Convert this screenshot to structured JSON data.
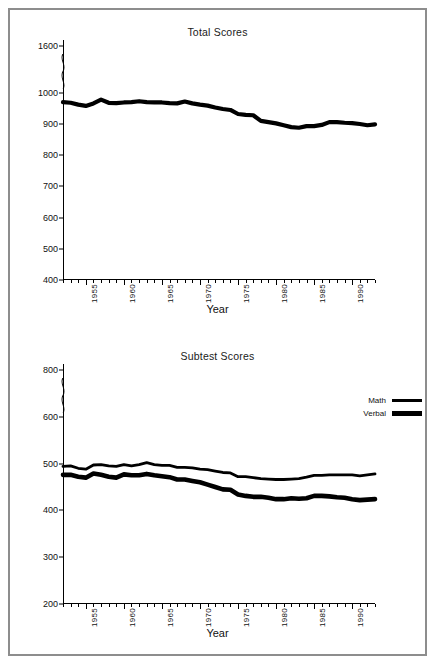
{
  "figure": {
    "border_color": "#8d8d8d",
    "background": "#ffffff",
    "line_color": "#000000"
  },
  "panels": {
    "total": {
      "title": "Total Scores",
      "xlabel": "Year",
      "ytick_labels": [
        "400",
        "500",
        "600",
        "700",
        "800",
        "900",
        "1000",
        "1600"
      ],
      "xtick_labels": [
        "1955",
        "1960",
        "1965",
        "1970",
        "1975",
        "1980",
        "1985",
        "1990"
      ]
    },
    "subtest": {
      "title": "Subtest Scores",
      "xlabel": "Year",
      "ytick_labels": [
        "200",
        "300",
        "400",
        "500",
        "600",
        "800"
      ],
      "xtick_labels": [
        "1955",
        "1960",
        "1965",
        "1970",
        "1975",
        "1980",
        "1985",
        "1990"
      ],
      "legend": {
        "math_label": "Math",
        "verbal_label": "Verbal"
      }
    }
  },
  "chart_data": [
    {
      "type": "line",
      "title": "Total Scores",
      "xlabel": "Year",
      "ylabel": "",
      "xlim": [
        1952,
        1993
      ],
      "ylim": [
        400,
        1000
      ],
      "y_axis_break": {
        "from": 1000,
        "to": 1600,
        "note": "axis broken between 1000 and 1600"
      },
      "ytick_values": [
        400,
        500,
        600,
        700,
        800,
        900,
        1000,
        1600
      ],
      "xtick_values": [
        1955,
        1960,
        1965,
        1970,
        1975,
        1980,
        1985,
        1990
      ],
      "grid": false,
      "legend_position": "none",
      "x": [
        1952,
        1953,
        1954,
        1955,
        1956,
        1957,
        1958,
        1959,
        1960,
        1961,
        1962,
        1963,
        1964,
        1965,
        1966,
        1967,
        1968,
        1969,
        1970,
        1971,
        1972,
        1973,
        1974,
        1975,
        1976,
        1977,
        1978,
        1979,
        1980,
        1981,
        1982,
        1983,
        1984,
        1985,
        1986,
        1987,
        1988,
        1989,
        1990,
        1991,
        1992,
        1993
      ],
      "series": [
        {
          "name": "Total",
          "values": [
            970,
            968,
            962,
            958,
            966,
            978,
            968,
            967,
            969,
            970,
            973,
            970,
            969,
            969,
            967,
            966,
            972,
            966,
            962,
            959,
            953,
            948,
            945,
            932,
            929,
            928,
            910,
            906,
            902,
            896,
            890,
            888,
            893,
            893,
            897,
            906,
            906,
            904,
            903,
            900,
            896,
            899
          ]
        }
      ]
    },
    {
      "type": "line",
      "title": "Subtest Scores",
      "xlabel": "Year",
      "ylabel": "",
      "xlim": [
        1952,
        1993
      ],
      "ylim": [
        200,
        600
      ],
      "y_axis_break": {
        "from": 600,
        "to": 800,
        "note": "axis broken between 600 and 800"
      },
      "ytick_values": [
        200,
        300,
        400,
        500,
        600,
        800
      ],
      "xtick_values": [
        1955,
        1960,
        1965,
        1970,
        1975,
        1980,
        1985,
        1990
      ],
      "grid": false,
      "legend_position": "upper right",
      "x": [
        1952,
        1953,
        1954,
        1955,
        1956,
        1957,
        1958,
        1959,
        1960,
        1961,
        1962,
        1963,
        1964,
        1965,
        1966,
        1967,
        1968,
        1969,
        1970,
        1971,
        1972,
        1973,
        1974,
        1975,
        1976,
        1977,
        1978,
        1979,
        1980,
        1981,
        1982,
        1983,
        1984,
        1985,
        1986,
        1987,
        1988,
        1989,
        1990,
        1991,
        1992,
        1993
      ],
      "series": [
        {
          "name": "Math",
          "values": [
            494,
            495,
            490,
            488,
            497,
            498,
            495,
            494,
            498,
            495,
            498,
            502,
            498,
            496,
            496,
            492,
            492,
            491,
            488,
            487,
            484,
            481,
            480,
            472,
            472,
            470,
            468,
            467,
            466,
            466,
            467,
            468,
            471,
            475,
            475,
            476,
            476,
            476,
            476,
            474,
            476,
            478
          ]
        },
        {
          "name": "Verbal",
          "values": [
            476,
            476,
            472,
            470,
            479,
            476,
            472,
            470,
            477,
            475,
            475,
            478,
            475,
            473,
            471,
            466,
            466,
            463,
            460,
            455,
            450,
            445,
            444,
            434,
            431,
            429,
            429,
            427,
            424,
            424,
            426,
            425,
            426,
            431,
            431,
            430,
            428,
            427,
            424,
            422,
            423,
            424
          ]
        }
      ]
    }
  ]
}
